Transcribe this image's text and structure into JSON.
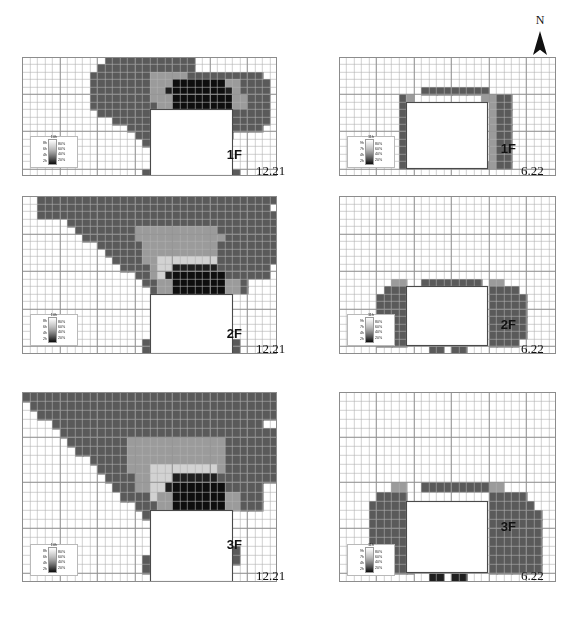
{
  "figure": {
    "north_label": "N",
    "north_icon": "north-arrow-icon"
  },
  "legend_winter": {
    "top_label": "10h",
    "hours": [
      "8h",
      "6h",
      "4h",
      "2h"
    ],
    "percents": [
      "80%",
      "60%",
      "40%",
      "20%"
    ]
  },
  "legend_summer": {
    "top_label": "11h",
    "hours": [
      "9h",
      "7h",
      "4h",
      "2h"
    ],
    "percents": [
      "80%",
      "60%",
      "40%",
      "20%"
    ]
  },
  "panels": [
    {
      "id": "p-1f-winter",
      "floor": "1F",
      "date": "12.21",
      "season": "winter",
      "column": "left",
      "row": 1
    },
    {
      "id": "p-1f-summer",
      "floor": "1F",
      "date": "6.22",
      "season": "summer",
      "column": "right",
      "row": 1
    },
    {
      "id": "p-2f-winter",
      "floor": "2F",
      "date": "12.21",
      "season": "winter",
      "column": "left",
      "row": 2
    },
    {
      "id": "p-2f-summer",
      "floor": "2F",
      "date": "6.22",
      "season": "summer",
      "column": "right",
      "row": 2
    },
    {
      "id": "p-3f-winter",
      "floor": "3F",
      "date": "12.21",
      "season": "winter",
      "column": "left",
      "row": 3
    },
    {
      "id": "p-3f-summer",
      "floor": "3F",
      "date": "6.22",
      "season": "summer",
      "column": "right",
      "row": 3
    }
  ],
  "colors": {
    "grid_line": "#b0b0b0",
    "frame": "#8c8c8c",
    "background": "#ffffff",
    "ink": "#111111",
    "shade_0": "#ffffff",
    "shade_20": "#1f1f1f",
    "shade_40": "#5a5a5a",
    "shade_60": "#9b9b9b",
    "shade_80": "#d2d2d2",
    "building": "#ffffff"
  },
  "chart_data": {
    "type": "heatmap",
    "title": "",
    "xlabel": "",
    "ylabel": "",
    "grid": true,
    "legend_position": "inside-bottom-left",
    "colorscale": {
      "winter": {
        "label": "sunlight hours / daylight ratio",
        "stops": [
          {
            "hours": "2h",
            "percent": "20%"
          },
          {
            "hours": "4h",
            "percent": "40%"
          },
          {
            "hours": "6h",
            "percent": "60%"
          },
          {
            "hours": "8h",
            "percent": "80%"
          },
          {
            "hours": "10h",
            "percent": "100%"
          }
        ]
      },
      "summer": {
        "label": "sunlight hours / daylight ratio",
        "stops": [
          {
            "hours": "2h",
            "percent": "20%"
          },
          {
            "hours": "4h",
            "percent": "40%"
          },
          {
            "hours": "7h",
            "percent": "60%"
          },
          {
            "hours": "9h",
            "percent": "80%"
          },
          {
            "hours": "11h",
            "percent": "100%"
          }
        ]
      }
    },
    "panels": [
      {
        "name": "1F 12.21",
        "floor": "1F",
        "date": "12.21",
        "cols": 34,
        "rows": 16,
        "building": {
          "x": 18,
          "y": 7,
          "w": 11,
          "h": 9
        },
        "notes": "large mid-grey shadow lobe to NW, dark 20-40% band directly N of building, grey wing to NE"
      },
      {
        "name": "1F 6.22",
        "floor": "1F",
        "date": "6.22",
        "cols": 34,
        "rows": 16,
        "building": {
          "x": 12,
          "y": 6,
          "w": 11,
          "h": 9
        },
        "notes": "narrow shadow ring hugging the building on N, W and E sides only"
      },
      {
        "name": "2F 12.21",
        "floor": "2F",
        "date": "12.21",
        "cols": 34,
        "rows": 20,
        "building": {
          "x": 18,
          "y": 13,
          "w": 11,
          "h": 7
        },
        "notes": "broad wedge-shaped shadow spreading NW and NE, dark core above building"
      },
      {
        "name": "2F 6.22",
        "floor": "2F",
        "date": "6.22",
        "cols": 34,
        "rows": 20,
        "building": {
          "x": 12,
          "y": 12,
          "w": 11,
          "h": 7
        },
        "notes": "shadow limited to flanks E and W plus thin strip on N"
      },
      {
        "name": "3F 12.21",
        "floor": "3F",
        "date": "12.21",
        "cols": 34,
        "rows": 20,
        "building": {
          "x": 18,
          "y": 13,
          "w": 11,
          "h": 7
        },
        "notes": "widest V-shaped shadow fan across the whole plot"
      },
      {
        "name": "3F 6.22",
        "floor": "3F",
        "date": "6.22",
        "cols": 34,
        "rows": 20,
        "building": {
          "x": 12,
          "y": 12,
          "w": 11,
          "h": 7
        },
        "notes": "rectangular shadow blocks flanking the building E and W"
      }
    ]
  }
}
